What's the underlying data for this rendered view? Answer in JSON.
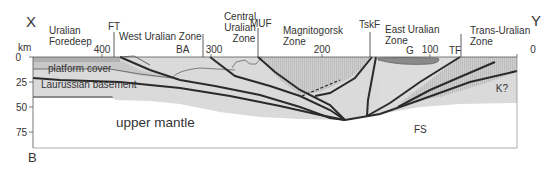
{
  "figure": {
    "panel_label": "B",
    "endpoints": {
      "left": "X",
      "right": "Y"
    },
    "axis": {
      "y_unit": "km",
      "y_ticks": [
        "0",
        "25",
        "50",
        "75"
      ],
      "x_ticks": [
        "400",
        "300",
        "200",
        "100",
        "0"
      ]
    },
    "zones": [
      {
        "line1": "Uralian",
        "line2": "Foredeep"
      },
      {
        "line1": "West Uralian Zone"
      },
      {
        "line1": "Central",
        "line2": "Uralian",
        "line3": "Zone"
      },
      {
        "line1": "Magnitogorsk",
        "line2": "Zone"
      },
      {
        "line1": "East Uralian",
        "line2": "Zone"
      },
      {
        "line1": "Trans-Uralian",
        "line2": "Zone"
      }
    ],
    "faults": [
      "FT",
      "MUF",
      "TskF",
      "TF"
    ],
    "features": [
      "BA",
      "G",
      "K?",
      "FS"
    ],
    "layers": [
      "platform cover",
      "Laurussian basement",
      "upper mantle"
    ]
  },
  "colors": {
    "upper_mantle": "#8c8c8c",
    "basement": "#d6d6d6",
    "platform_cover": "#c4c4c4",
    "crust_light": "#e0e0e0",
    "crust_hatched": "#c9c9c9",
    "granite": "#8a8a8a",
    "fault_line": "#2a2a2a"
  }
}
